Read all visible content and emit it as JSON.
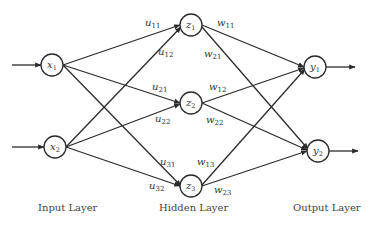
{
  "diagram": {
    "type": "neural-network",
    "colors": {
      "line": "#2b2b2b",
      "text": "#333333",
      "background": "#ffffff"
    },
    "layers": [
      {
        "label": "Input Layer",
        "nodes": [
          {
            "id": "x1",
            "base": "x",
            "sub": "1"
          },
          {
            "id": "x2",
            "base": "x",
            "sub": "2"
          }
        ]
      },
      {
        "label": "Hidden Layer",
        "nodes": [
          {
            "id": "z1",
            "base": "z",
            "sub": "1"
          },
          {
            "id": "z2",
            "base": "z",
            "sub": "2"
          },
          {
            "id": "z3",
            "base": "z",
            "sub": "3"
          }
        ]
      },
      {
        "label": "Output Layer",
        "nodes": [
          {
            "id": "y1",
            "base": "y",
            "sub": "1"
          },
          {
            "id": "y2",
            "base": "y",
            "sub": "2"
          }
        ]
      }
    ],
    "input_weights": [
      {
        "base": "u",
        "sub": "11"
      },
      {
        "base": "u",
        "sub": "12"
      },
      {
        "base": "u",
        "sub": "21"
      },
      {
        "base": "u",
        "sub": "22"
      },
      {
        "base": "u",
        "sub": "31"
      },
      {
        "base": "u",
        "sub": "32"
      }
    ],
    "output_weights": [
      {
        "base": "w",
        "sub": "11"
      },
      {
        "base": "w",
        "sub": "21"
      },
      {
        "base": "w",
        "sub": "12"
      },
      {
        "base": "w",
        "sub": "22"
      },
      {
        "base": "w",
        "sub": "13"
      },
      {
        "base": "w",
        "sub": "23"
      }
    ]
  }
}
